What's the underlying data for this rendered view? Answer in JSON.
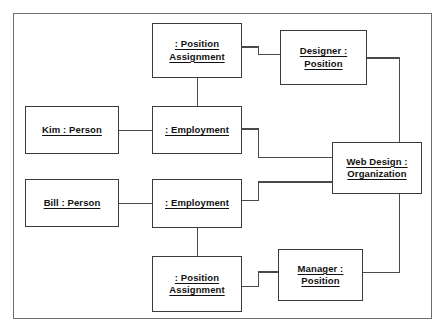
{
  "diagram": {
    "kind": "object-diagram",
    "frame": {
      "name": "diagram-frame"
    },
    "objects": [
      {
        "id": "position-assignment-top",
        "name": "position-assignment-top",
        "lines": [
          ": Position",
          "Assignment"
        ],
        "instance": "",
        "classifier": "Position Assignment"
      },
      {
        "id": "designer-position",
        "name": "designer-position",
        "lines": [
          "Designer :",
          "Position"
        ],
        "instance": "Designer",
        "classifier": "Position"
      },
      {
        "id": "kim-person",
        "name": "kim-person",
        "lines": [
          "Kim : Person"
        ],
        "instance": "Kim",
        "classifier": "Person"
      },
      {
        "id": "employment-upper",
        "name": "employment-upper",
        "lines": [
          ": Employment"
        ],
        "instance": "",
        "classifier": "Employment"
      },
      {
        "id": "web-design-organization",
        "name": "web-design-organization",
        "lines": [
          "Web Design :",
          "Organization"
        ],
        "instance": "Web Design",
        "classifier": "Organization"
      },
      {
        "id": "bill-person",
        "name": "bill-person",
        "lines": [
          "Bill : Person"
        ],
        "instance": "Bill",
        "classifier": "Person"
      },
      {
        "id": "employment-lower",
        "name": "employment-lower",
        "lines": [
          ": Employment"
        ],
        "instance": "",
        "classifier": "Employment"
      },
      {
        "id": "position-assignment-bottom",
        "name": "position-assignment-bottom",
        "lines": [
          ": Position",
          "Assignment"
        ],
        "instance": "",
        "classifier": "Position Assignment"
      },
      {
        "id": "manager-position",
        "name": "manager-position",
        "lines": [
          "Manager :",
          "Position"
        ],
        "instance": "Manager",
        "classifier": "Position"
      }
    ],
    "links": [
      {
        "name": "link-position-assignment-top-to-designer",
        "from": "position-assignment-top",
        "to": "designer-position"
      },
      {
        "name": "link-position-assignment-top-to-employment-upper",
        "from": "position-assignment-top",
        "to": "employment-upper"
      },
      {
        "name": "link-kim-to-employment-upper",
        "from": "kim-person",
        "to": "employment-upper"
      },
      {
        "name": "link-employment-upper-to-web-design",
        "from": "employment-upper",
        "to": "web-design-organization"
      },
      {
        "name": "link-bill-to-employment-lower",
        "from": "bill-person",
        "to": "employment-lower"
      },
      {
        "name": "link-employment-lower-to-web-design",
        "from": "employment-lower",
        "to": "web-design-organization"
      },
      {
        "name": "link-employment-lower-to-position-assignment-bottom",
        "from": "employment-lower",
        "to": "position-assignment-bottom"
      },
      {
        "name": "link-position-assignment-bottom-to-manager",
        "from": "position-assignment-bottom",
        "to": "manager-position"
      },
      {
        "name": "link-designer-to-manager",
        "from": "designer-position",
        "to": "manager-position"
      }
    ],
    "colors": {
      "box_border": "#3a3a3a",
      "frame_border": "#6e6e6e",
      "line": "#4a4a4a",
      "text": "#111111",
      "background": "#ffffff"
    }
  }
}
